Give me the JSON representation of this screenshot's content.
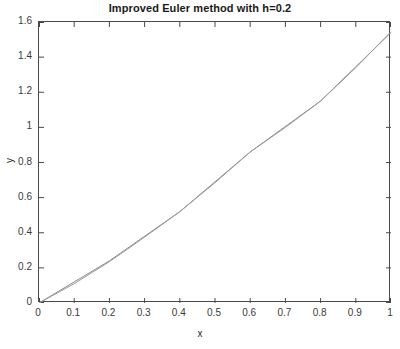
{
  "chart_data": {
    "type": "line",
    "title": "Improved Euler method with h=0.2",
    "xlabel": "x",
    "ylabel": "y",
    "xlim": [
      0,
      1
    ],
    "ylim": [
      0,
      1.6
    ],
    "grid": false,
    "legend": null,
    "xticks": [
      "0",
      "0.1",
      "0.2",
      "0.3",
      "0.4",
      "0.5",
      "0.6",
      "0.7",
      "0.8",
      "0.9",
      "1"
    ],
    "xtick_values": [
      0,
      0.1,
      0.2,
      0.3,
      0.4,
      0.5,
      0.6,
      0.7,
      0.8,
      0.9,
      1
    ],
    "yticks": [
      "0",
      "0.2",
      "0.4",
      "0.6",
      "0.8",
      "1",
      "1.2",
      "1.4",
      "1.6"
    ],
    "ytick_values": [
      0,
      0.2,
      0.4,
      0.6,
      0.8,
      1.0,
      1.2,
      1.4,
      1.6
    ],
    "series": [
      {
        "name": "Improved Euler h=0.2",
        "color": "#8a8a8a",
        "x": [
          0,
          0.2,
          0.4,
          0.6,
          0.8,
          1.0
        ],
        "values": [
          0,
          0.24,
          0.52,
          0.86,
          1.15,
          1.54
        ]
      },
      {
        "name": "Exact solution",
        "color": "#9a9a9a",
        "x": [
          0,
          0.1,
          0.2,
          0.3,
          0.4,
          0.5,
          0.6,
          0.7,
          0.8,
          0.9,
          1.0
        ],
        "values": [
          0,
          0.11,
          0.235,
          0.375,
          0.52,
          0.685,
          0.86,
          1.0,
          1.15,
          1.34,
          1.545
        ]
      }
    ]
  }
}
